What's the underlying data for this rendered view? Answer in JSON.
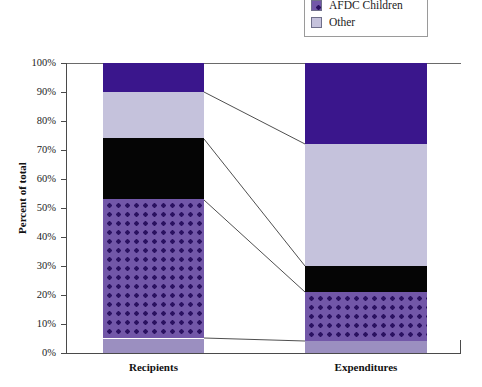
{
  "legend": {
    "items": [
      {
        "label": "AFDC Children",
        "swatch": "afdc-children-swatch",
        "color": "#3a168c",
        "pattern": "dotted"
      },
      {
        "label": "Other",
        "swatch": "other-swatch",
        "color": "#c5c2dc",
        "pattern": "solid"
      }
    ]
  },
  "axes": {
    "ylabel": "Percent of total",
    "yticks": [
      "0%",
      "10%",
      "20%",
      "30%",
      "40%",
      "50%",
      "60%",
      "70%",
      "80%",
      "90%",
      "100%"
    ],
    "xticks": [
      "Recipients",
      "Expenditures"
    ]
  },
  "caption": "",
  "chart_data": {
    "type": "bar",
    "subtype": "100% stacked bar",
    "title": "",
    "xlabel": "",
    "ylabel": "Percent of total",
    "ylim": [
      0,
      100
    ],
    "ytick_step": 10,
    "grid": false,
    "legend_position": "top-right",
    "categories": [
      "Recipients",
      "Expenditures"
    ],
    "series": [
      {
        "name": "Segment 1 (bottom)",
        "style": "light-purple",
        "color": "#9b8fc0",
        "values": [
          5,
          4
        ]
      },
      {
        "name": "AFDC Children",
        "style": "dotted-purple",
        "color": "#7257a8",
        "values": [
          48,
          17
        ]
      },
      {
        "name": "Segment 3",
        "style": "black",
        "color": "#050505",
        "values": [
          21,
          9
        ]
      },
      {
        "name": "Other",
        "style": "lavender",
        "color": "#c5c2dc",
        "values": [
          16,
          42
        ]
      },
      {
        "name": "Segment 5 (top)",
        "style": "dark-purple",
        "color": "#3a168c",
        "values": [
          10,
          28
        ]
      }
    ],
    "cumulative_boundaries": {
      "Recipients": [
        0,
        5,
        53,
        74,
        90,
        100
      ],
      "Expenditures": [
        0,
        4,
        21,
        30,
        72,
        100
      ]
    }
  }
}
